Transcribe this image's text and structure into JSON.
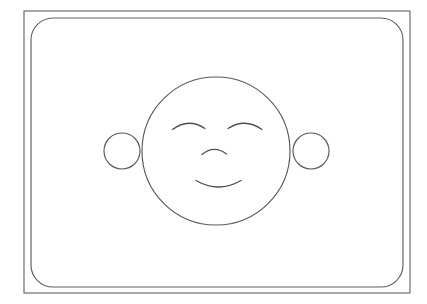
{
  "canvas": {
    "width": 427,
    "height": 304,
    "background_color": "#ffffff",
    "title": "Smiley Face Line Drawing"
  },
  "palette": {
    "outer_frame_stroke": "#6e6e6e",
    "inner_frame_stroke": "#5f5f5f",
    "shape_stroke": "#5a5a5a",
    "feature_stroke": "#4f4f4f",
    "fill": "none"
  },
  "figure": {
    "name": "smiling-face"
  },
  "shapes": {
    "outer_frame": {
      "name": "outer-rectangle-border",
      "x": 24,
      "y": 11,
      "width": 386,
      "height": 282,
      "rx": 0,
      "stroke_width": 1.2
    },
    "inner_frame": {
      "name": "inner-rounded-rectangle",
      "x": 31,
      "y": 18,
      "width": 372,
      "height": 269,
      "rx": 22,
      "stroke_width": 1.15
    },
    "face": {
      "name": "face-circle",
      "cx": 216,
      "cy": 151,
      "r": 74,
      "stroke_width": 1.15
    },
    "ear_left": {
      "name": "left-ear-circle",
      "cx": 122,
      "cy": 151,
      "r": 18,
      "stroke_width": 1.15
    },
    "ear_right": {
      "name": "right-ear-circle",
      "cx": 311,
      "cy": 151,
      "r": 18,
      "stroke_width": 1.15
    }
  },
  "features": {
    "eye_left": {
      "name": "left-eye-arc",
      "path": "M 172.5 129.5 Q 188.5 117.5 205 128.5",
      "stroke_width": 1.3
    },
    "eye_right": {
      "name": "right-eye-arc",
      "path": "M 228 128.5 Q 245 117.5 262 129.5",
      "stroke_width": 1.3
    },
    "nose": {
      "name": "nose-arc",
      "path": "M 202 154.5 Q 214 144.5 226.5 154",
      "stroke_width": 1.3
    },
    "mouth": {
      "name": "mouth-smile-arc",
      "path": "M 196 180.5 Q 218.5 193.5 241 180.5",
      "stroke_width": 1.3
    }
  }
}
